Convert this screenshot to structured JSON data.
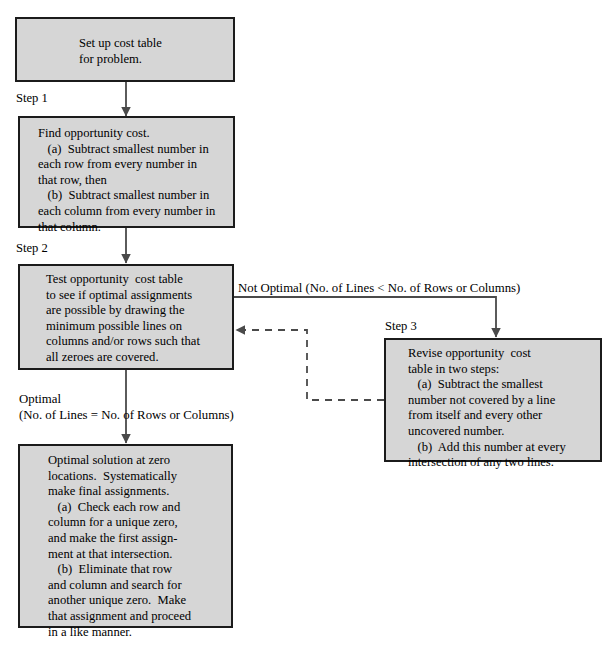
{
  "diagram": {
    "title_text": "",
    "colors": {
      "box_fill": "#d6d6d6",
      "box_border": "#1b1b1b",
      "wire": "#4a4a4a",
      "text": "#000000",
      "background": "#ffffff"
    },
    "boxes": [
      {
        "id": "setup-cost-table",
        "text": "Set up cost table\nfor problem."
      },
      {
        "id": "find-opportunity-cost",
        "text": "Find opportunity cost.\n   (a)  Subtract smallest number in\neach row from every number in\nthat row, then\n   (b)  Subtract smallest number in\neach column from every number in\nthat column."
      },
      {
        "id": "test-opportunity-cost-table",
        "text": "Test opportunity  cost table\nto see if optimal assignments\nare possible by drawing the\nminimum possible lines on\ncolumns and/or rows such that\nall zeroes are covered."
      },
      {
        "id": "revise-opportunity-cost-table",
        "text": "Revise opportunity  cost\ntable in two steps:\n   (a)  Subtract the smallest\nnumber not covered by a line\nfrom itself and every other\nuncovered number.\n   (b)  Add this number at every\nintersection of any two lines."
      },
      {
        "id": "optimal-solution",
        "text": "Optimal solution at zero\nlocations.  Systematically\nmake final assignments.\n   (a)  Check each row and\ncolumn for a unique zero,\nand make the first assign-\nment at that intersection.\n   (b)  Eliminate that row\nand column and search for\nanother unique zero.  Make\nthat assignment and proceed\nin a like manner."
      }
    ],
    "step_labels": [
      {
        "id": "step-1",
        "text": "Step 1"
      },
      {
        "id": "step-2",
        "text": "Step 2"
      },
      {
        "id": "step-3",
        "text": "Step 3"
      }
    ],
    "edge_labels": [
      {
        "id": "not-optimal",
        "text": "Not Optimal (No. of Lines < No. of Rows or Columns)"
      },
      {
        "id": "optimal",
        "text": "Optimal"
      },
      {
        "id": "optimal-condition",
        "text": "(No. of Lines = No. of Rows or Columns)"
      }
    ]
  }
}
